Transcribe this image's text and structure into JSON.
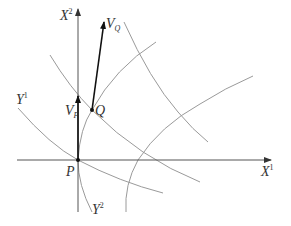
{
  "diagram": {
    "axes": {
      "x_axis": {
        "base": "X",
        "sup": "1"
      },
      "y_axis": {
        "base": "X",
        "sup": "2"
      }
    },
    "points": {
      "P": {
        "label": "P"
      },
      "Q": {
        "label": "Q"
      }
    },
    "vectors": {
      "VP": {
        "base": "V",
        "sub": "P"
      },
      "VQ": {
        "base": "V",
        "sub": "Q"
      }
    },
    "curve_labels": {
      "Y1": {
        "base": "Y",
        "sup": "1"
      },
      "Y2": {
        "base": "Y",
        "sup": "2"
      }
    },
    "colors": {
      "axis": "#555555",
      "curve": "#9a9a9a",
      "vector": "#222222",
      "text": "#333333"
    }
  }
}
